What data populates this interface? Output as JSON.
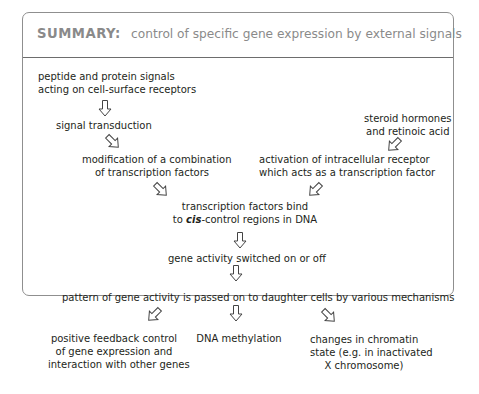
{
  "header": {
    "label": "SUMMARY:",
    "title": "control of specific gene expression by external signals"
  },
  "nodes": {
    "peptide_signals": [
      "peptide and protein signals",
      "acting on cell-surface receptors"
    ],
    "signal_transduction": [
      "signal transduction"
    ],
    "steroid": [
      "steroid hormones",
      "and retinoic acid"
    ],
    "modification": [
      "modification of a combination",
      "of transcription factors"
    ],
    "activation": [
      "activation of intracellular receptor",
      "which acts as a transcription factor"
    ],
    "tf_bind": {
      "line1": "transcription factors bind",
      "line2_prefix": "to ",
      "line2_italic": "cis",
      "line2_suffix": "-control regions in DNA"
    },
    "gene_switched": [
      "gene activity switched on or off"
    ],
    "pattern": [
      "pattern of gene activity is passed on to daughter cells by various mechanisms"
    ],
    "positive_feedback": [
      "positive feedback control",
      "of gene expression and",
      "interaction with other genes"
    ],
    "dna_methylation": [
      "DNA methylation"
    ],
    "chromatin": [
      "changes in chromatin",
      "state (e.g. in inactivated",
      "X chromosome)"
    ]
  },
  "arrows": [
    {
      "id": "peptide-to-transduction",
      "direction": "down"
    },
    {
      "id": "transduction-to-modification",
      "direction": "down-right"
    },
    {
      "id": "steroid-to-activation",
      "direction": "down-left"
    },
    {
      "id": "modification-to-bind",
      "direction": "down-right"
    },
    {
      "id": "activation-to-bind",
      "direction": "down-left"
    },
    {
      "id": "bind-to-switched",
      "direction": "down"
    },
    {
      "id": "switched-to-pattern",
      "direction": "down"
    },
    {
      "id": "pattern-to-feedback",
      "direction": "down-left"
    },
    {
      "id": "pattern-to-methylation",
      "direction": "down"
    },
    {
      "id": "pattern-to-chromatin",
      "direction": "down-right"
    }
  ],
  "colors": {
    "header_text": "#8a8a8a",
    "border": "#8f8f8f",
    "text": "#231f20"
  }
}
